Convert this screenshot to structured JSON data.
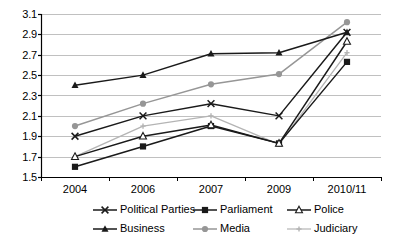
{
  "chart_data": {
    "type": "line",
    "title": "",
    "xlabel": "",
    "ylabel": "",
    "categories": [
      "2004",
      "2006",
      "2007",
      "2009",
      "2010/11"
    ],
    "ylim": [
      1.5,
      3.1
    ],
    "ytick_step": 0.2,
    "yticks": [
      "3.1",
      "2.9",
      "2.7",
      "2.5",
      "2.3",
      "2.1",
      "1.9",
      "1.7",
      "1.5"
    ],
    "grid": "horizontal",
    "legend_position": "bottom",
    "series": [
      {
        "name": "Political Parties",
        "marker": "cross-x",
        "color": "#1a1a1a",
        "values": [
          1.9,
          2.1,
          2.22,
          2.1,
          2.92
        ]
      },
      {
        "name": "Parliament",
        "marker": "filled-square",
        "color": "#1a1a1a",
        "values": [
          1.6,
          1.8,
          2.0,
          1.83,
          2.63
        ]
      },
      {
        "name": "Police",
        "marker": "hollow-triangle",
        "color": "#1a1a1a",
        "values": [
          1.7,
          1.9,
          2.01,
          1.83,
          2.83
        ]
      },
      {
        "name": "Business",
        "marker": "filled-triangle",
        "color": "#1a1a1a",
        "values": [
          2.4,
          2.5,
          2.71,
          2.72,
          2.92
        ]
      },
      {
        "name": "Media",
        "marker": "filled-circle",
        "color": "#969696",
        "values": [
          2.0,
          2.22,
          2.41,
          2.51,
          3.02
        ]
      },
      {
        "name": "Judiciary",
        "marker": "small-plus",
        "color": "#b4b4b4",
        "values": [
          1.7,
          2.0,
          2.1,
          1.82,
          2.72
        ]
      }
    ]
  },
  "legend": {
    "rows": [
      [
        "Political Parties",
        "Parliament",
        "Police"
      ],
      [
        "Business",
        "Media",
        "Judiciary"
      ]
    ]
  },
  "colors": {
    "axis": "#000000",
    "gridline": "#b0b0b0",
    "dark_series": "#1a1a1a",
    "media_gray": "#969696",
    "judiciary_gray": "#b4b4b4",
    "background": "#ffffff"
  }
}
